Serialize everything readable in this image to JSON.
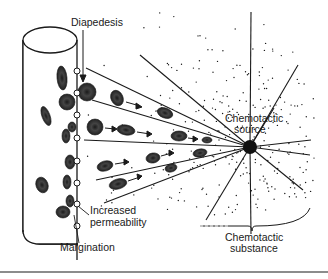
{
  "diagram": {
    "labels": {
      "diapedesis": "Diapedesis",
      "chemotactic_source_line1": "Chemotactic",
      "chemotactic_source_line2": "source",
      "increased_permeability_line1": "Increased",
      "increased_permeability_line2": "permeability",
      "margination": "Margination",
      "chemotactic_substance_line1": "Chemotactic",
      "chemotactic_substance_line2": "substance"
    },
    "elements": {
      "blood_vessel": "cylinder",
      "chemotactic_source": "black dot",
      "gradient": "dotted stipple",
      "leukocytes_migrating": 12,
      "pores_in_vessel_wall": 8
    },
    "colors": {
      "ink": "#1a1a1a",
      "cell_fill": "#3a3a3a",
      "background": "#ffffff"
    }
  }
}
